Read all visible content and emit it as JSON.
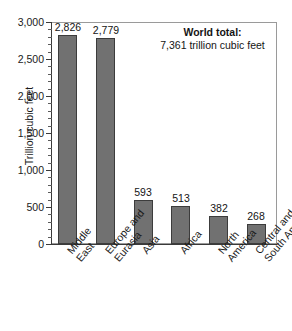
{
  "chart_data": {
    "type": "bar",
    "title": "",
    "subtitle": "",
    "xlabel": "",
    "ylabel": "Trillion cubic feet",
    "categories": [
      "Middle East",
      "Europe and Eurasia",
      "Asia",
      "Africa",
      "North America",
      "Central and South America"
    ],
    "category_lines": [
      [
        "Middle",
        "East"
      ],
      [
        "Europe and",
        "Eurasia"
      ],
      [
        "Asia"
      ],
      [
        "Africa"
      ],
      [
        "North",
        "America"
      ],
      [
        "Central and",
        "South America"
      ]
    ],
    "values": [
      2826,
      2779,
      593,
      513,
      382,
      268
    ],
    "value_labels": [
      "2,826",
      "2,779",
      "593",
      "513",
      "382",
      "268"
    ],
    "ylim": [
      0,
      3000
    ],
    "ytick_values": [
      0,
      500,
      1000,
      1500,
      2000,
      2500,
      3000
    ],
    "ytick_labels": [
      "0",
      "500",
      "1,000",
      "1,500",
      "2,000",
      "2,500",
      "3,000"
    ],
    "y_minor_tick_interval": 100,
    "grid": false,
    "legend": null,
    "legend_position": "none",
    "bar_color": "#717171",
    "bar_edge_color": "#3c3c3c",
    "annotations": [
      {
        "title": "World total:",
        "subtitle": "7,361 trillion cubic feet"
      }
    ]
  },
  "annotation": {
    "title": "World total:",
    "subtitle": "7,361 trillion cubic feet"
  }
}
